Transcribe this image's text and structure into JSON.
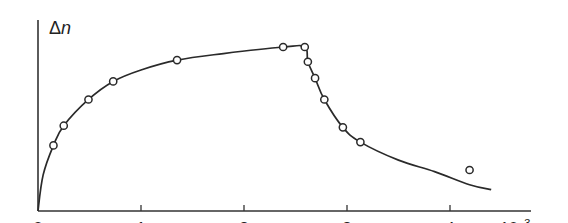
{
  "chart_data": {
    "type": "line",
    "title": "",
    "xlabel": "10^-3 t",
    "ylabel": "Δn",
    "xlabel_prefix": "10",
    "xlabel_exp": "−3",
    "xlabel_var": "t",
    "ylabel_main": "Δ",
    "ylabel_var": "n",
    "x_ticks": [
      "0",
      "1",
      "2",
      "3",
      "4"
    ],
    "xlim": [
      0,
      4.8
    ],
    "ylim": [
      0,
      1.05
    ],
    "grid": false,
    "legend": null,
    "series": [
      {
        "name": "measured points",
        "marker": "open-circle",
        "x": [
          0.15,
          0.25,
          0.49,
          0.73,
          1.35,
          2.38,
          2.59,
          2.62,
          2.69,
          2.78,
          2.96,
          3.13,
          4.19
        ],
        "y": [
          0.4,
          0.52,
          0.68,
          0.79,
          0.92,
          1.0,
          1.0,
          0.91,
          0.81,
          0.68,
          0.51,
          0.42,
          0.25
        ]
      },
      {
        "name": "fitted curve",
        "marker": "none",
        "x": [
          0,
          0.05,
          0.15,
          0.25,
          0.49,
          0.73,
          1.0,
          1.35,
          1.8,
          2.38,
          2.59,
          2.62,
          2.69,
          2.78,
          2.96,
          3.13,
          3.5,
          3.85,
          4.19,
          4.4
        ],
        "y": [
          0,
          0.22,
          0.4,
          0.52,
          0.68,
          0.79,
          0.86,
          0.92,
          0.96,
          1.0,
          1.0,
          0.91,
          0.81,
          0.68,
          0.51,
          0.42,
          0.31,
          0.24,
          0.16,
          0.13
        ]
      }
    ]
  }
}
